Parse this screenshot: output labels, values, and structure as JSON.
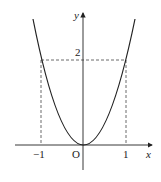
{
  "figure": {
    "type": "function-graph",
    "function": "y = 2x^2",
    "axes": {
      "x_label": "x",
      "y_label": "y",
      "origin_label": "O"
    },
    "ticks": {
      "x_neg": "−1",
      "x_pos": "1",
      "y_val": "2"
    },
    "guide_lines": {
      "horizontal_y": 2,
      "vertical_x": [
        -1,
        1
      ],
      "style": "dashed"
    },
    "colors": {
      "curve": "#222222",
      "axes": "#222222",
      "dashed": "#444444"
    }
  }
}
